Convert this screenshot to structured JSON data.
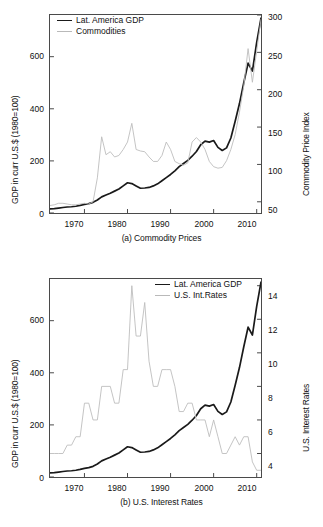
{
  "figure": {
    "background": "#ffffff",
    "series_colors": {
      "gdp": "#1a1a1a",
      "commodities": "#bdbdbd",
      "interest_rates": "#bdbdbd"
    }
  },
  "panel_a": {
    "caption": "(a) Commodity Prices",
    "legend": [
      {
        "label": "Lat. America GDP",
        "style": "dark"
      },
      {
        "label": "Commodities",
        "style": "light"
      }
    ],
    "left_axis_label": "GDP in curr U.S.$ (1980=100)",
    "right_axis_label": "Commodity Price Index",
    "left_ticks": [
      "0",
      "200",
      "400",
      "600"
    ],
    "right_ticks": [
      "50",
      "100",
      "150",
      "200",
      "250",
      "300"
    ],
    "x_ticks": [
      "1970",
      "1980",
      "1990",
      "2000",
      "2010"
    ]
  },
  "panel_b": {
    "caption": "(b) U.S. Interest Rates",
    "legend": [
      {
        "label": "Lat. America GDP",
        "style": "dark"
      },
      {
        "label": "U.S. Int.Rates",
        "style": "light"
      }
    ],
    "left_axis_label": "GDP in curr U.S.$ (1980=100)",
    "right_axis_label": "U.S. Interest Rates",
    "left_ticks": [
      "0",
      "200",
      "400",
      "600"
    ],
    "right_ticks": [
      "4",
      "6",
      "8",
      "10",
      "12",
      "14"
    ],
    "x_ticks": [
      "1970",
      "1980",
      "1990",
      "2000",
      "2010"
    ]
  },
  "chart_data": [
    {
      "type": "line",
      "id": "panel-a",
      "title": "(a) Commodity Prices",
      "xlabel": "",
      "ylabel": "GDP in curr U.S.$ (1980=100)",
      "y2label": "Commodity Price Index",
      "xlim": [
        1962,
        2011
      ],
      "ylim": [
        0,
        760
      ],
      "y2lim": [
        35,
        300
      ],
      "yticks": [
        0,
        200,
        400,
        600
      ],
      "y2ticks": [
        50,
        100,
        150,
        200,
        250,
        300
      ],
      "xticks": [
        1970,
        1980,
        1990,
        2000,
        2010
      ],
      "grid": false,
      "legend_position": "top-left",
      "x": [
        1962,
        1963,
        1964,
        1965,
        1966,
        1967,
        1968,
        1969,
        1970,
        1971,
        1972,
        1973,
        1974,
        1975,
        1976,
        1977,
        1978,
        1979,
        1980,
        1981,
        1982,
        1983,
        1984,
        1985,
        1986,
        1987,
        1988,
        1989,
        1990,
        1991,
        1992,
        1993,
        1994,
        1995,
        1996,
        1997,
        1998,
        1999,
        2000,
        2001,
        2002,
        2003,
        2004,
        2005,
        2006,
        2007,
        2008,
        2009,
        2010,
        2011
      ],
      "series": [
        {
          "name": "Lat. America GDP",
          "axis": "left",
          "color": "#1a1a1a",
          "values": [
            16,
            17,
            19,
            21,
            23,
            24,
            26,
            29,
            33,
            36,
            41,
            50,
            62,
            69,
            76,
            84,
            92,
            104,
            116,
            113,
            104,
            95,
            96,
            98,
            104,
            112,
            124,
            136,
            148,
            162,
            178,
            190,
            202,
            218,
            236,
            262,
            276,
            272,
            278,
            252,
            240,
            250,
            288,
            352,
            420,
            500,
            575,
            545,
            655,
            748
          ]
        },
        {
          "name": "Commodities",
          "axis": "right",
          "color": "#bdbdbd",
          "values": [
            45,
            46,
            48,
            48,
            47,
            46,
            46,
            47,
            48,
            47,
            50,
            82,
            137,
            113,
            117,
            110,
            112,
            120,
            130,
            155,
            120,
            118,
            117,
            110,
            104,
            104,
            112,
            130,
            120,
            104,
            101,
            99,
            102,
            130,
            136,
            130,
            120,
            104,
            97,
            95,
            96,
            105,
            120,
            140,
            170,
            205,
            255,
            210,
            252,
            294
          ]
        }
      ]
    },
    {
      "type": "line",
      "id": "panel-b",
      "title": "(b) U.S. Interest Rates",
      "xlabel": "",
      "ylabel": "GDP in curr U.S.$ (1980=100)",
      "y2label": "U.S. Interest Rates",
      "xlim": [
        1962,
        2011
      ],
      "ylim": [
        0,
        760
      ],
      "y2lim": [
        2.6,
        14.4
      ],
      "yticks": [
        0,
        200,
        400,
        600
      ],
      "y2ticks": [
        4,
        6,
        8,
        10,
        12,
        14
      ],
      "xticks": [
        1970,
        1980,
        1990,
        2000,
        2010
      ],
      "grid": false,
      "legend_position": "top-right",
      "x": [
        1962,
        1963,
        1964,
        1965,
        1966,
        1967,
        1968,
        1969,
        1970,
        1971,
        1972,
        1973,
        1974,
        1975,
        1976,
        1977,
        1978,
        1979,
        1980,
        1981,
        1982,
        1983,
        1984,
        1985,
        1986,
        1987,
        1988,
        1989,
        1990,
        1991,
        1992,
        1993,
        1994,
        1995,
        1996,
        1997,
        1998,
        1999,
        2000,
        2001,
        2002,
        2003,
        2004,
        2005,
        2006,
        2007,
        2008,
        2009,
        2010,
        2011
      ],
      "series": [
        {
          "name": "Lat. America GDP",
          "axis": "left",
          "color": "#1a1a1a",
          "values": [
            16,
            17,
            19,
            21,
            23,
            24,
            26,
            29,
            33,
            36,
            41,
            50,
            62,
            69,
            76,
            84,
            92,
            104,
            116,
            113,
            104,
            95,
            96,
            98,
            104,
            112,
            124,
            136,
            148,
            162,
            178,
            190,
            202,
            218,
            236,
            262,
            276,
            272,
            278,
            252,
            240,
            250,
            288,
            352,
            420,
            500,
            575,
            545,
            655,
            748
          ]
        },
        {
          "name": "U.S. Int.Rates",
          "axis": "right",
          "color": "#bdbdbd",
          "values": [
            4.0,
            4.0,
            4.0,
            4.0,
            4.5,
            4.5,
            5.0,
            5.0,
            7.0,
            7.0,
            6.0,
            6.0,
            8.0,
            8.0,
            8.0,
            7.0,
            7.0,
            9.0,
            9.0,
            14.0,
            11.0,
            11.0,
            13.0,
            9.5,
            8.0,
            8.0,
            9.0,
            9.0,
            9.0,
            8.0,
            6.5,
            6.5,
            7.0,
            7.0,
            6.0,
            6.0,
            6.0,
            5.0,
            6.0,
            5.0,
            4.0,
            4.0,
            4.5,
            5.0,
            4.5,
            5.0,
            5.0,
            3.5,
            3.0,
            3.0
          ]
        }
      ]
    }
  ]
}
